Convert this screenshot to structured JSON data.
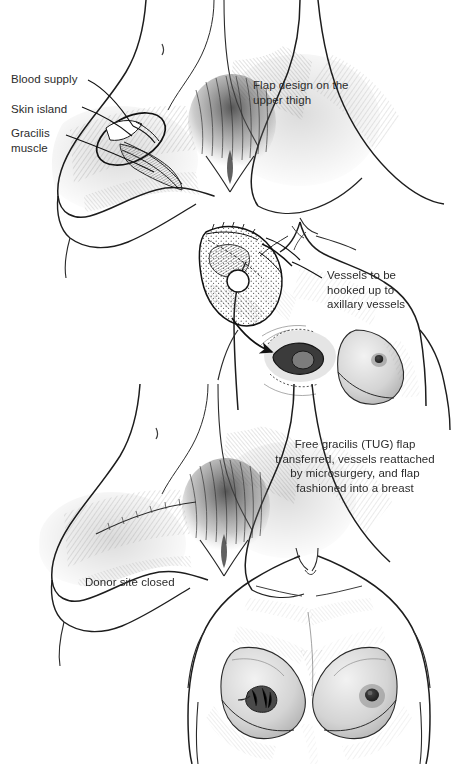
{
  "figure": {
    "width": 459,
    "height": 764,
    "background_color": "#ffffff",
    "ink_color": "#2b2b2b",
    "style": "pen-and-ink medical illustration, graphite hatching"
  },
  "labels": {
    "blood_supply": "Blood supply",
    "skin_island": "Skin island",
    "gracilis_muscle": "Gracilis\nmuscle",
    "flap_design": "Flap design on the\nupper thigh",
    "vessels": "Vessels to be\nhooked up to\naxillary vessels",
    "free_gracilis": "Free gracilis (TUG) flap\ntransferred, vessels reattached\nby microsurgery, and flap\nfashioned into a breast",
    "donor_site": "Donor site closed"
  },
  "panels": [
    {
      "id": "upper-thigh-flap-design",
      "position": "top-left",
      "caption": "Flap design on the upper thigh",
      "annotations": [
        "Blood supply",
        "Skin island",
        "Gracilis muscle"
      ]
    },
    {
      "id": "flap-transfer-to-chest",
      "position": "middle-right",
      "caption": "Vessels to be hooked up to axillary vessels",
      "annotations": [
        "harvested flap with skin island",
        "mastectomy defect",
        "transfer arrow"
      ]
    },
    {
      "id": "donor-site-closed",
      "position": "bottom-left",
      "caption": "Donor site closed",
      "annotations": []
    },
    {
      "id": "reconstructed-breast",
      "position": "bottom-right",
      "caption": "Free gracilis (TUG) flap transferred, vessels reattached by microsurgery, and flap fashioned into a breast",
      "annotations": []
    }
  ]
}
